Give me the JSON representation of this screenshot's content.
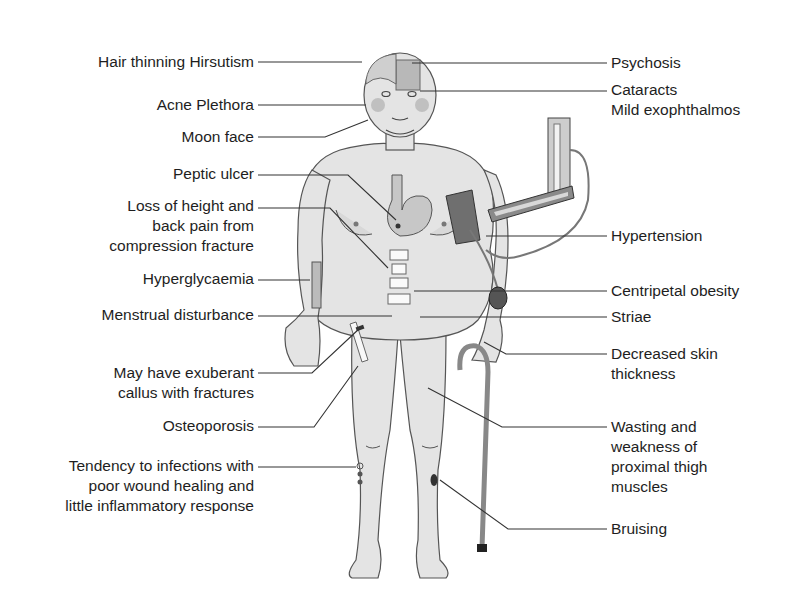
{
  "diagram": {
    "colors": {
      "ink": "#1e1e1e",
      "skin": "#e4e4e4",
      "outline": "#555555",
      "dark": "#6a6a6a",
      "leader": "#333333"
    },
    "left_labels": [
      {
        "lines": [
          "Hair thinning Hirsutism"
        ]
      },
      {
        "lines": [
          "Acne Plethora"
        ]
      },
      {
        "lines": [
          "Moon face"
        ]
      },
      {
        "lines": [
          "Peptic ulcer"
        ]
      },
      {
        "lines": [
          "Loss of height and",
          "back pain from",
          "compression fracture"
        ]
      },
      {
        "lines": [
          "Hyperglycaemia"
        ]
      },
      {
        "lines": [
          "Menstrual disturbance"
        ]
      },
      {
        "lines": [
          "May have exuberant",
          "callus with fractures"
        ]
      },
      {
        "lines": [
          "Osteoporosis"
        ]
      },
      {
        "lines": [
          "Tendency to infections with",
          "poor wound healing and",
          "little inflammatory response"
        ]
      }
    ],
    "right_labels": [
      {
        "lines": [
          "Psychosis"
        ]
      },
      {
        "lines": [
          "Cataracts",
          "Mild exophthalmos"
        ]
      },
      {
        "lines": [
          "Hypertension"
        ]
      },
      {
        "lines": [
          "Centripetal obesity"
        ]
      },
      {
        "lines": [
          "Striae"
        ]
      },
      {
        "lines": [
          "Decreased skin",
          "thickness"
        ]
      },
      {
        "lines": [
          "Wasting and",
          "weakness of",
          "proximal thigh",
          "muscles"
        ]
      },
      {
        "lines": [
          "Bruising"
        ]
      }
    ]
  }
}
